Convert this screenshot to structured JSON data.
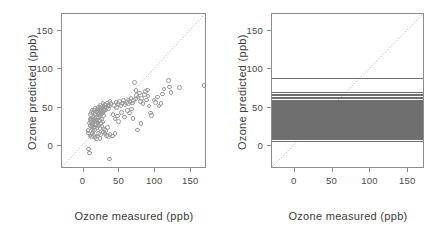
{
  "figure": {
    "background": "#ffffff",
    "marker_color": "#9a9a9a",
    "line_color": "#6f6f6f",
    "frame_color": "#8d8d8d",
    "diagonal_color": "#b9b9b9"
  },
  "chart_data": [
    {
      "type": "scatter",
      "panel": "left",
      "title": "",
      "xlabel": "Ozone measured (ppb)",
      "ylabel": "Ozone predicted (ppb)",
      "xlim": [
        -30,
        172
      ],
      "ylim": [
        -30,
        172
      ],
      "xticks": [
        0,
        50,
        100,
        150
      ],
      "yticks": [
        0,
        50,
        100,
        150
      ],
      "xticklabels": [
        "0",
        "50",
        "100",
        "150"
      ],
      "yticklabels": [
        "0",
        "50",
        "100",
        "150"
      ],
      "grid": false,
      "legend": null,
      "reference_line": {
        "type": "identity",
        "label": "y = x",
        "style": "dotted"
      },
      "marker": "open-circle",
      "points": [
        [
          7,
          -4
        ],
        [
          8,
          -9
        ],
        [
          9,
          13
        ],
        [
          36,
          -17
        ],
        [
          6,
          20
        ],
        [
          7,
          17
        ],
        [
          11,
          12
        ],
        [
          12,
          16
        ],
        [
          13,
          19
        ],
        [
          14,
          14
        ],
        [
          16,
          11
        ],
        [
          18,
          9
        ],
        [
          20,
          13
        ],
        [
          21,
          16
        ],
        [
          23,
          10
        ],
        [
          24,
          15
        ],
        [
          11,
          25
        ],
        [
          12,
          28
        ],
        [
          13,
          31
        ],
        [
          14,
          24
        ],
        [
          15,
          33
        ],
        [
          16,
          36
        ],
        [
          17,
          29
        ],
        [
          18,
          38
        ],
        [
          19,
          34
        ],
        [
          20,
          41
        ],
        [
          21,
          37
        ],
        [
          22,
          43
        ],
        [
          23,
          39
        ],
        [
          24,
          45
        ],
        [
          25,
          42
        ],
        [
          26,
          47
        ],
        [
          27,
          44
        ],
        [
          28,
          40
        ],
        [
          29,
          46
        ],
        [
          30,
          49
        ],
        [
          9,
          35
        ],
        [
          10,
          41
        ],
        [
          11,
          44
        ],
        [
          12,
          47
        ],
        [
          13,
          38
        ],
        [
          14,
          43
        ],
        [
          15,
          46
        ],
        [
          16,
          49
        ],
        [
          17,
          42
        ],
        [
          18,
          45
        ],
        [
          19,
          48
        ],
        [
          20,
          51
        ],
        [
          21,
          44
        ],
        [
          22,
          47
        ],
        [
          23,
          50
        ],
        [
          24,
          53
        ],
        [
          25,
          46
        ],
        [
          26,
          52
        ],
        [
          27,
          55
        ],
        [
          28,
          48
        ],
        [
          29,
          51
        ],
        [
          30,
          54
        ],
        [
          31,
          47
        ],
        [
          32,
          50
        ],
        [
          33,
          56
        ],
        [
          34,
          53
        ],
        [
          35,
          49
        ],
        [
          36,
          52
        ],
        [
          37,
          58
        ],
        [
          38,
          55
        ],
        [
          8,
          30
        ],
        [
          9,
          27
        ],
        [
          10,
          33
        ],
        [
          11,
          36
        ],
        [
          12,
          22
        ],
        [
          13,
          26
        ],
        [
          14,
          34
        ],
        [
          15,
          21
        ],
        [
          16,
          25
        ],
        [
          17,
          32
        ],
        [
          18,
          28
        ],
        [
          19,
          24
        ],
        [
          20,
          30
        ],
        [
          21,
          27
        ],
        [
          22,
          33
        ],
        [
          23,
          23
        ],
        [
          24,
          29
        ],
        [
          25,
          35
        ],
        [
          26,
          26
        ],
        [
          27,
          31
        ],
        [
          28,
          18
        ],
        [
          29,
          22
        ],
        [
          30,
          16
        ],
        [
          31,
          20
        ],
        [
          32,
          14
        ],
        [
          33,
          24
        ],
        [
          35,
          12
        ],
        [
          37,
          15
        ],
        [
          40,
          13
        ],
        [
          44,
          16
        ],
        [
          41,
          41
        ],
        [
          43,
          53
        ],
        [
          45,
          57
        ],
        [
          46,
          50
        ],
        [
          48,
          55
        ],
        [
          50,
          58
        ],
        [
          52,
          52
        ],
        [
          54,
          56
        ],
        [
          56,
          59
        ],
        [
          58,
          54
        ],
        [
          60,
          57
        ],
        [
          62,
          60
        ],
        [
          63,
          55
        ],
        [
          65,
          58
        ],
        [
          66,
          62
        ],
        [
          68,
          56
        ],
        [
          70,
          59
        ],
        [
          72,
          61
        ],
        [
          44,
          35
        ],
        [
          47,
          39
        ],
        [
          49,
          32
        ],
        [
          53,
          44
        ],
        [
          57,
          38
        ],
        [
          61,
          46
        ],
        [
          64,
          43
        ],
        [
          67,
          48
        ],
        [
          69,
          36
        ],
        [
          71,
          83
        ],
        [
          73,
          72
        ],
        [
          74,
          66
        ],
        [
          76,
          64
        ],
        [
          78,
          69
        ],
        [
          79,
          58
        ],
        [
          81,
          62
        ],
        [
          83,
          55
        ],
        [
          85,
          67
        ],
        [
          86,
          71
        ],
        [
          88,
          60
        ],
        [
          89,
          73
        ],
        [
          90,
          65
        ],
        [
          91,
          52
        ],
        [
          93,
          43
        ],
        [
          75,
          21
        ],
        [
          80,
          29
        ],
        [
          95,
          40
        ],
        [
          98,
          60
        ],
        [
          100,
          57
        ],
        [
          103,
          64
        ],
        [
          105,
          52
        ],
        [
          108,
          55
        ],
        [
          110,
          68
        ],
        [
          112,
          74
        ],
        [
          118,
          85
        ],
        [
          120,
          77
        ],
        [
          122,
          70
        ],
        [
          134,
          76
        ],
        [
          168,
          79
        ]
      ]
    },
    {
      "type": "line",
      "panel": "right",
      "title": "",
      "xlabel": "Ozone measured (ppb)",
      "ylabel": "Ozone predicted (ppb)",
      "xlim": [
        -30,
        172
      ],
      "ylim": [
        -30,
        172
      ],
      "xticks": [
        0,
        50,
        100,
        150
      ],
      "yticks": [
        0,
        50,
        100,
        150
      ],
      "xticklabels": [
        "0",
        "50",
        "100",
        "150"
      ],
      "yticklabels": [
        "0",
        "50",
        "100",
        "150"
      ],
      "grid": false,
      "legend": null,
      "reference_line": {
        "type": "identity",
        "label": "y = x",
        "style": "dotted"
      },
      "orientation": "horizontal-rug",
      "hline_values": [
        7,
        9,
        10,
        12,
        13,
        14,
        15,
        16,
        17,
        18,
        19,
        20,
        21,
        22,
        23,
        24,
        25,
        26,
        27,
        28,
        29,
        30,
        31,
        32,
        33,
        34,
        35,
        36,
        37,
        38,
        39,
        40,
        41,
        42,
        43,
        44,
        45,
        46,
        47,
        48,
        49,
        50,
        51,
        52,
        53,
        54,
        55,
        56,
        57,
        58,
        59,
        60,
        62,
        64,
        66,
        68,
        71,
        88
      ]
    }
  ]
}
